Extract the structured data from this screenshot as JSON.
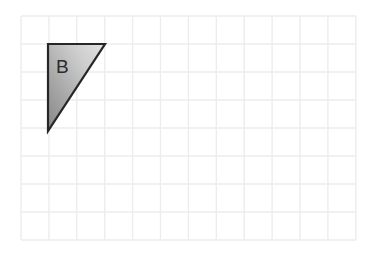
{
  "figure": {
    "width": 373,
    "height": 254,
    "background_color": "#ffffff"
  },
  "grid": {
    "name": "square-grid",
    "origin_x": 21,
    "origin_y": 16,
    "columns": 12,
    "rows": 8,
    "cell_width": 27.9,
    "cell_height": 28,
    "right_edge_x": 356,
    "bottom_edge_y": 240,
    "line_color": "#ededf0",
    "line_width": 1.4,
    "grid_on": true
  },
  "shapes": [
    {
      "name": "triangle-b",
      "label": "B",
      "type": "right-triangle",
      "vertices_px": [
        [
          48,
          44
        ],
        [
          105,
          44
        ],
        [
          48,
          131
        ]
      ],
      "vertices_grid": [
        [
          1,
          1
        ],
        [
          3,
          1
        ],
        [
          1,
          4
        ]
      ],
      "legs": {
        "horizontal_cells": 2,
        "vertical_cells": 3
      },
      "stroke_color": "#262626",
      "stroke_width": 2.2,
      "fill": {
        "type": "linear-gradient",
        "from_color": "#8c8c8c",
        "mid_color": "#bcbcbc",
        "to_color": "#dcdcdc",
        "direction": "bottom-left to top-right"
      },
      "label_position_px": [
        56,
        73
      ],
      "label_color": "#2b2b2b",
      "label_font_size": 19
    }
  ]
}
